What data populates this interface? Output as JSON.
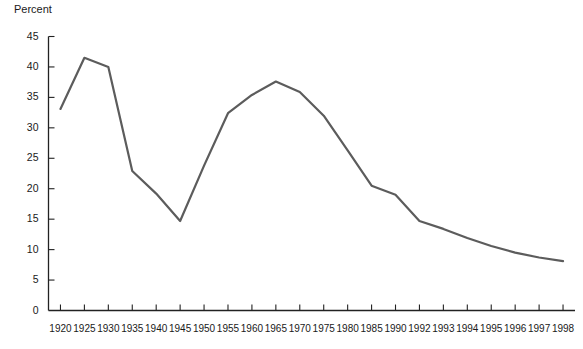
{
  "chart_data": {
    "type": "line",
    "title": "",
    "ylabel": "Percent",
    "xlabel": "",
    "ylim": [
      0,
      45
    ],
    "ytick_step": 5,
    "yticks": [
      0,
      5,
      10,
      15,
      20,
      25,
      30,
      35,
      40,
      45
    ],
    "grid": false,
    "legend": null,
    "line_color": "#5c5c5c",
    "line_width": 2.2,
    "categories": [
      "1920",
      "1925",
      "1930",
      "1935",
      "1940",
      "1945",
      "1950",
      "1955",
      "1960",
      "1965",
      "1970",
      "1975",
      "1980",
      "1985",
      "1990",
      "1992",
      "1993",
      "1994",
      "1995",
      "1996",
      "1997",
      "1998"
    ],
    "values": [
      33.1,
      41.5,
      40.0,
      22.9,
      19.2,
      14.7,
      23.8,
      32.4,
      35.4,
      37.6,
      35.9,
      32.0,
      26.3,
      20.5,
      19.0,
      14.7,
      13.4,
      11.9,
      10.6,
      9.5,
      8.7,
      8.1
    ],
    "series": [
      {
        "name": "Percent",
        "values": [
          33.1,
          41.5,
          40.0,
          22.9,
          19.2,
          14.7,
          23.8,
          32.4,
          35.4,
          37.6,
          35.9,
          32.0,
          26.3,
          20.5,
          19.0,
          14.7,
          13.4,
          11.9,
          10.6,
          9.5,
          8.7,
          8.1
        ]
      }
    ]
  }
}
